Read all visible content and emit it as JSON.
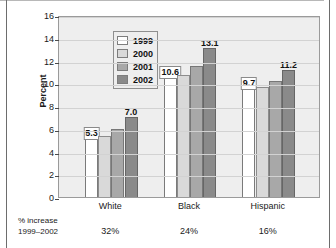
{
  "chart_data": {
    "type": "bar",
    "title": "",
    "xlabel": "",
    "ylabel": "Percent",
    "ylim": [
      0,
      16
    ],
    "yticks": [
      0,
      2,
      4,
      6,
      8,
      10,
      12,
      14,
      16
    ],
    "ytick_labels": [
      "0",
      "2",
      "4",
      "6",
      "8",
      "10",
      "12",
      "14",
      "16"
    ],
    "grid": true,
    "legend_position": "upper-left-inside",
    "categories": [
      "White",
      "Black",
      "Hispanic"
    ],
    "series": [
      {
        "name": "1999",
        "color": "#ffffff",
        "values": [
          5.3,
          10.6,
          9.7
        ]
      },
      {
        "name": "2000",
        "color": "#d9d9d9",
        "values": [
          5.4,
          10.7,
          9.7
        ]
      },
      {
        "name": "2001",
        "color": "#a8a8a8",
        "values": [
          6.0,
          11.5,
          10.2
        ]
      },
      {
        "name": "2002",
        "color": "#8a8a8a",
        "values": [
          7.0,
          13.1,
          11.2
        ]
      }
    ],
    "point_labels": [
      {
        "category": "White",
        "series": "1999",
        "text": "5.3",
        "style": "boxed"
      },
      {
        "category": "White",
        "series": "2002",
        "text": "7.0",
        "style": "plain"
      },
      {
        "category": "Black",
        "series": "1999",
        "text": "10.6",
        "style": "boxed"
      },
      {
        "category": "Black",
        "series": "2002",
        "text": "13.1",
        "style": "plain"
      },
      {
        "category": "Hispanic",
        "series": "1999",
        "text": "9.7",
        "style": "boxed"
      },
      {
        "category": "Hispanic",
        "series": "2002",
        "text": "11.2",
        "style": "plain"
      }
    ],
    "annotations": {
      "footer_label_line1": "% increase",
      "footer_label_line2": "1999–2002",
      "footer_values": [
        "32%",
        "24%",
        "16%"
      ]
    }
  },
  "legend": {
    "items": [
      {
        "label": "1999"
      },
      {
        "label": "2000"
      },
      {
        "label": "2001"
      },
      {
        "label": "2002"
      }
    ]
  },
  "axis": {
    "y_title": "Percent"
  }
}
